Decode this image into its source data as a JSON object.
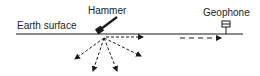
{
  "labels": {
    "surface": "Earth surface",
    "hammer": "Hammer",
    "geophone": "Geophone"
  },
  "colors": {
    "ink": "#1a1a1a",
    "background": "#ffffff"
  }
}
